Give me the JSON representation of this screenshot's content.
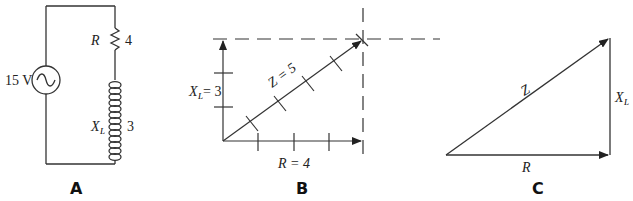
{
  "panels": {
    "a": {
      "caption": "A",
      "source_label": "15 V",
      "resistor_symbol": "R",
      "resistor_value": "4",
      "inductor_symbol": "X",
      "inductor_subscript": "L",
      "inductor_value": "3"
    },
    "b": {
      "caption": "B",
      "vertical_label_symbol": "X",
      "vertical_label_subscript": "L",
      "vertical_label_value": " = 3",
      "horizontal_label": "R = 4",
      "hypotenuse_label": "Z = 5"
    },
    "c": {
      "caption": "C",
      "hypotenuse_label": "Z",
      "horizontal_label": "R",
      "vertical_label_symbol": "X",
      "vertical_label_subscript": "L"
    }
  }
}
